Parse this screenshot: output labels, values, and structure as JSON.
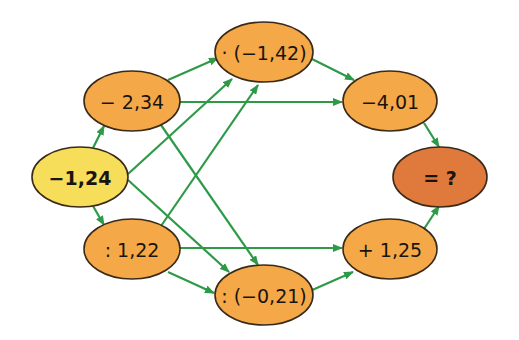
{
  "diagram": {
    "type": "operation-flow-graph",
    "colors": {
      "start_fill": "#f7de5a",
      "step_fill": "#f4a847",
      "result_fill": "#df7a3c",
      "edge": "#2e9a48",
      "outline": "#3a2a1a"
    },
    "nodes": [
      {
        "id": "start",
        "label": "−1,24",
        "kind": "start",
        "cx": 80,
        "cy": 177,
        "rx": 48,
        "ry": 30,
        "bold": true
      },
      {
        "id": "sub",
        "label": "− 2,34",
        "kind": "step",
        "cx": 132,
        "cy": 101,
        "rx": 48,
        "ry": 30
      },
      {
        "id": "mul",
        "label": "· (−1,42)",
        "kind": "step",
        "cx": 264,
        "cy": 52,
        "rx": 49,
        "ry": 30
      },
      {
        "id": "r1",
        "label": "−4,01",
        "kind": "step",
        "cx": 390,
        "cy": 101,
        "rx": 47,
        "ry": 30
      },
      {
        "id": "result",
        "label": "= ?",
        "kind": "result",
        "cx": 440,
        "cy": 177,
        "rx": 47,
        "ry": 30,
        "bold": true
      },
      {
        "id": "div",
        "label": ": 1,22",
        "kind": "step",
        "cx": 132,
        "cy": 249,
        "rx": 48,
        "ry": 30
      },
      {
        "id": "div2",
        "label": ": (−0,21)",
        "kind": "step",
        "cx": 264,
        "cy": 295,
        "rx": 49,
        "ry": 30
      },
      {
        "id": "add",
        "label": "+ 1,25",
        "kind": "step",
        "cx": 390,
        "cy": 249,
        "rx": 47,
        "ry": 30
      }
    ],
    "edges": [
      {
        "from": "start",
        "to": "sub",
        "x1": 93,
        "y1": 148,
        "x2": 104,
        "y2": 126
      },
      {
        "from": "start",
        "to": "div",
        "x1": 93,
        "y1": 206,
        "x2": 104,
        "y2": 225
      },
      {
        "from": "start",
        "to": "mul",
        "x1": 128,
        "y1": 174,
        "x2": 232,
        "y2": 79
      },
      {
        "from": "start",
        "to": "div2",
        "x1": 128,
        "y1": 180,
        "x2": 229,
        "y2": 272
      },
      {
        "from": "sub",
        "to": "mul",
        "x1": 168,
        "y1": 80,
        "x2": 218,
        "y2": 58
      },
      {
        "from": "sub",
        "to": "r1",
        "x1": 180,
        "y1": 102,
        "x2": 342,
        "y2": 102
      },
      {
        "from": "sub",
        "to": "div2",
        "x1": 161,
        "y1": 125,
        "x2": 258,
        "y2": 265
      },
      {
        "from": "div",
        "to": "mul",
        "x1": 161,
        "y1": 226,
        "x2": 258,
        "y2": 85
      },
      {
        "from": "div",
        "to": "add",
        "x1": 180,
        "y1": 248,
        "x2": 342,
        "y2": 248
      },
      {
        "from": "div",
        "to": "div2",
        "x1": 168,
        "y1": 272,
        "x2": 214,
        "y2": 293
      },
      {
        "from": "mul",
        "to": "r1",
        "x1": 310,
        "y1": 58,
        "x2": 354,
        "y2": 80
      },
      {
        "from": "div2",
        "to": "add",
        "x1": 310,
        "y1": 291,
        "x2": 353,
        "y2": 272
      },
      {
        "from": "r1",
        "to": "result",
        "x1": 424,
        "y1": 123,
        "x2": 439,
        "y2": 147
      },
      {
        "from": "add",
        "to": "result",
        "x1": 424,
        "y1": 229,
        "x2": 439,
        "y2": 206
      }
    ]
  },
  "labels": {
    "start": "−1,24",
    "sub": "− 2,34",
    "mul": "· (−1,42)",
    "r1": "−4,01",
    "result": "= ?",
    "div": ": 1,22",
    "div2": ": (−0,21)",
    "add": "+ 1,25"
  }
}
